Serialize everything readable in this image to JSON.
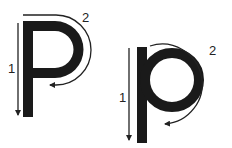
{
  "diagram": {
    "colors": {
      "ink": "#1a1a1a",
      "arrow": "#222222",
      "background": "#ffffff"
    },
    "letters": [
      {
        "glyph": "P",
        "case": "uppercase",
        "strokes": [
          {
            "number": "1",
            "description": "straight line down"
          },
          {
            "number": "2",
            "description": "back to top, curve around and in"
          }
        ]
      },
      {
        "glyph": "p",
        "case": "lowercase",
        "strokes": [
          {
            "number": "1",
            "description": "straight line down"
          },
          {
            "number": "2",
            "description": "back up, curve around and in"
          }
        ]
      }
    ]
  }
}
